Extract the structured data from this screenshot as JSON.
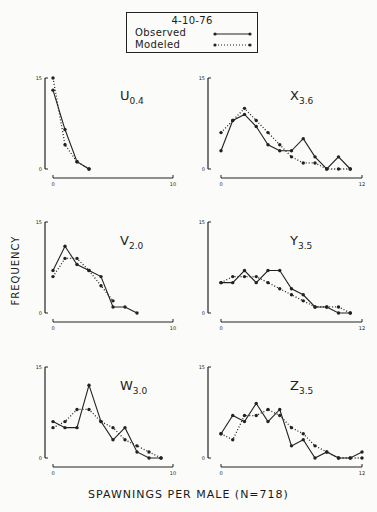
{
  "legend": {
    "title": "4-10-76",
    "observed_label": "Observed",
    "modeled_label": "Modeled"
  },
  "axes": {
    "ylabel": "FREQUENCY",
    "xlabel": "SPAWNINGS PER MALE (N=718)"
  },
  "chart_data": [
    {
      "type": "line",
      "panel": "U",
      "title": "U",
      "subscript": "0.4",
      "xlabel": "SPAWNINGS PER MALE",
      "ylabel": "FREQUENCY",
      "xlim": [
        0,
        10
      ],
      "ylim": [
        0,
        15
      ],
      "xticks": [
        "0",
        "10"
      ],
      "yticks": [
        "0",
        "15"
      ],
      "series": [
        {
          "name": "Observed",
          "style": "solid",
          "x": [
            0,
            1,
            2,
            3
          ],
          "values": [
            13,
            6.5,
            1.2,
            0
          ]
        },
        {
          "name": "Modeled",
          "style": "dotted",
          "x": [
            0,
            1,
            2,
            3
          ],
          "values": [
            15,
            4,
            1.2,
            0
          ]
        }
      ]
    },
    {
      "type": "line",
      "panel": "X",
      "title": "X",
      "subscript": "3.6",
      "xlabel": "SPAWNINGS PER MALE",
      "ylabel": "FREQUENCY",
      "xlim": [
        0,
        12
      ],
      "ylim": [
        0,
        15
      ],
      "xticks": [
        "0",
        "12"
      ],
      "yticks": [
        "0",
        "15"
      ],
      "series": [
        {
          "name": "Observed",
          "style": "solid",
          "x": [
            0,
            1,
            2,
            3,
            4,
            5,
            6,
            7,
            8,
            9,
            10,
            11
          ],
          "values": [
            3,
            8,
            9,
            7,
            4,
            3,
            3,
            5,
            2,
            0,
            2,
            0
          ]
        },
        {
          "name": "Modeled",
          "style": "dotted",
          "x": [
            0,
            1,
            2,
            3,
            4,
            5,
            6,
            7,
            8,
            9,
            10,
            11
          ],
          "values": [
            6,
            8,
            10,
            8,
            6,
            4,
            2,
            1,
            1,
            0,
            0,
            0
          ]
        }
      ]
    },
    {
      "type": "line",
      "panel": "V",
      "title": "V",
      "subscript": "2.0",
      "xlabel": "SPAWNINGS PER MALE",
      "ylabel": "FREQUENCY",
      "xlim": [
        0,
        10
      ],
      "ylim": [
        0,
        15
      ],
      "xticks": [
        "0",
        "10"
      ],
      "yticks": [
        "0",
        "15"
      ],
      "series": [
        {
          "name": "Observed",
          "style": "solid",
          "x": [
            0,
            1,
            2,
            3,
            4,
            5,
            6,
            7
          ],
          "values": [
            7,
            11,
            8,
            7,
            6,
            1,
            1,
            0
          ]
        },
        {
          "name": "Modeled",
          "style": "dotted",
          "x": [
            0,
            1,
            2,
            3,
            4,
            5
          ],
          "values": [
            6,
            9,
            9,
            7,
            4.5,
            2
          ]
        }
      ]
    },
    {
      "type": "line",
      "panel": "Y",
      "title": "Y",
      "subscript": "3.5",
      "xlabel": "SPAWNINGS PER MALE",
      "ylabel": "FREQUENCY",
      "xlim": [
        0,
        12
      ],
      "ylim": [
        0,
        15
      ],
      "xticks": [
        "0",
        "12"
      ],
      "yticks": [
        "0",
        "15"
      ],
      "series": [
        {
          "name": "Observed",
          "style": "solid",
          "x": [
            0,
            1,
            2,
            3,
            4,
            5,
            6,
            7,
            8,
            9,
            10,
            11
          ],
          "values": [
            5,
            5,
            7,
            5,
            7,
            7,
            4,
            3,
            1,
            1,
            0,
            0
          ]
        },
        {
          "name": "Modeled",
          "style": "dotted",
          "x": [
            0,
            1,
            2,
            3,
            4,
            5,
            6,
            7,
            8,
            9,
            10,
            11
          ],
          "values": [
            5,
            6,
            6,
            6,
            5,
            4,
            3,
            2,
            1,
            1,
            1,
            0
          ]
        }
      ]
    },
    {
      "type": "line",
      "panel": "W",
      "title": "W",
      "subscript": "3.0",
      "xlabel": "SPAWNINGS PER MALE",
      "ylabel": "FREQUENCY",
      "xlim": [
        0,
        10
      ],
      "ylim": [
        0,
        15
      ],
      "xticks": [
        "0",
        "10"
      ],
      "yticks": [
        "0",
        "15"
      ],
      "series": [
        {
          "name": "Observed",
          "style": "solid",
          "x": [
            0,
            1,
            2,
            3,
            4,
            5,
            6,
            7,
            8,
            9
          ],
          "values": [
            6,
            5,
            5,
            12,
            6,
            3,
            5,
            1,
            0,
            0
          ]
        },
        {
          "name": "Modeled",
          "style": "dotted",
          "x": [
            0,
            1,
            2,
            3,
            4,
            5,
            6,
            7,
            8,
            9
          ],
          "values": [
            5,
            6,
            8,
            8,
            6,
            5,
            3,
            2,
            1,
            0
          ]
        }
      ]
    },
    {
      "type": "line",
      "panel": "Z",
      "title": "Z",
      "subscript": "3.5",
      "xlabel": "SPAWNINGS PER MALE",
      "ylabel": "FREQUENCY",
      "xlim": [
        0,
        12
      ],
      "ylim": [
        0,
        15
      ],
      "xticks": [
        "0",
        "12"
      ],
      "yticks": [
        "0",
        "15"
      ],
      "series": [
        {
          "name": "Observed",
          "style": "solid",
          "x": [
            0,
            1,
            2,
            3,
            4,
            5,
            6,
            7,
            8,
            9,
            10,
            11,
            12
          ],
          "values": [
            4,
            7,
            6,
            9,
            6,
            8,
            2,
            3,
            0,
            1,
            0,
            0,
            1
          ]
        },
        {
          "name": "Modeled",
          "style": "dotted",
          "x": [
            0,
            1,
            2,
            3,
            4,
            5,
            6,
            7,
            8,
            9,
            10,
            11,
            12
          ],
          "values": [
            4,
            3,
            7,
            7,
            8,
            7,
            5,
            4,
            2,
            1,
            0,
            0,
            0
          ]
        }
      ]
    }
  ]
}
